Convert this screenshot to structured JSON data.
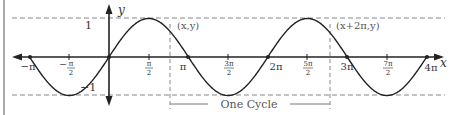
{
  "chart_data": {
    "type": "line",
    "title": "",
    "function": "y = sin(x)",
    "xlabel": "x",
    "ylabel": "y",
    "xlim": [
      -3.14159,
      12.566
    ],
    "ylim": [
      -1,
      1
    ],
    "grid": false,
    "x_ticks": [
      {
        "value": -3.14159,
        "label": "−π",
        "kind": "plain"
      },
      {
        "value": -1.5708,
        "label_num": "π",
        "label_den": "2",
        "sign": "−",
        "kind": "frac"
      },
      {
        "value": 1.5708,
        "label_num": "π",
        "label_den": "2",
        "sign": "",
        "kind": "frac"
      },
      {
        "value": 3.14159,
        "label": "π",
        "kind": "plain"
      },
      {
        "value": 4.7124,
        "label_num": "3π",
        "label_den": "2",
        "sign": "",
        "kind": "frac"
      },
      {
        "value": 6.2832,
        "label": "2π",
        "kind": "plain"
      },
      {
        "value": 7.854,
        "label_num": "5π",
        "label_den": "2",
        "sign": "",
        "kind": "frac"
      },
      {
        "value": 9.4248,
        "label": "3π",
        "kind": "plain"
      },
      {
        "value": 10.9956,
        "label_num": "7π",
        "label_den": "2",
        "sign": "",
        "kind": "frac"
      },
      {
        "value": 12.566,
        "label": "4π",
        "kind": "plain"
      }
    ],
    "y_ticks": [
      {
        "value": 1,
        "label": "1"
      },
      {
        "value": -1,
        "label": "−1"
      }
    ],
    "series": [
      {
        "name": "sin(x)",
        "x_range": [
          -3.14159,
          12.566
        ],
        "samples": "continuous"
      }
    ],
    "reference_lines": [
      {
        "type": "horizontal",
        "y": 1,
        "style": "dashed"
      },
      {
        "type": "horizontal",
        "y": -1,
        "style": "dashed"
      },
      {
        "type": "vertical",
        "x": 2.6,
        "style": "dashed"
      },
      {
        "type": "vertical",
        "x": 8.88,
        "style": "dashed"
      }
    ],
    "annotations": [
      {
        "text": "(x,y)",
        "x": 2.6,
        "y": 0.52
      },
      {
        "text": "(x+2π,y)",
        "x": 8.88,
        "y": 0.52
      },
      {
        "text": "One Cycle",
        "type": "bracket",
        "x_from": 2.6,
        "x_to": 8.88
      }
    ]
  },
  "labels": {
    "y_axis": "y",
    "x_axis": "x",
    "y_one": "1",
    "y_neg_one": "−1",
    "point_a": "(x,y)",
    "point_b": "(x+2π,y)",
    "cycle": "One Cycle",
    "neg_pi": "−π",
    "neg_half_pi_num": "π",
    "neg_half_pi_den": "2",
    "half_pi_num": "π",
    "half_pi_den": "2",
    "pi": "π",
    "three_half_pi_num": "3π",
    "three_half_pi_den": "2",
    "two_pi": "2π",
    "five_half_pi_num": "5π",
    "five_half_pi_den": "2",
    "three_pi": "3π",
    "seven_half_pi_num": "7π",
    "seven_half_pi_den": "2",
    "four_pi": "4π"
  }
}
